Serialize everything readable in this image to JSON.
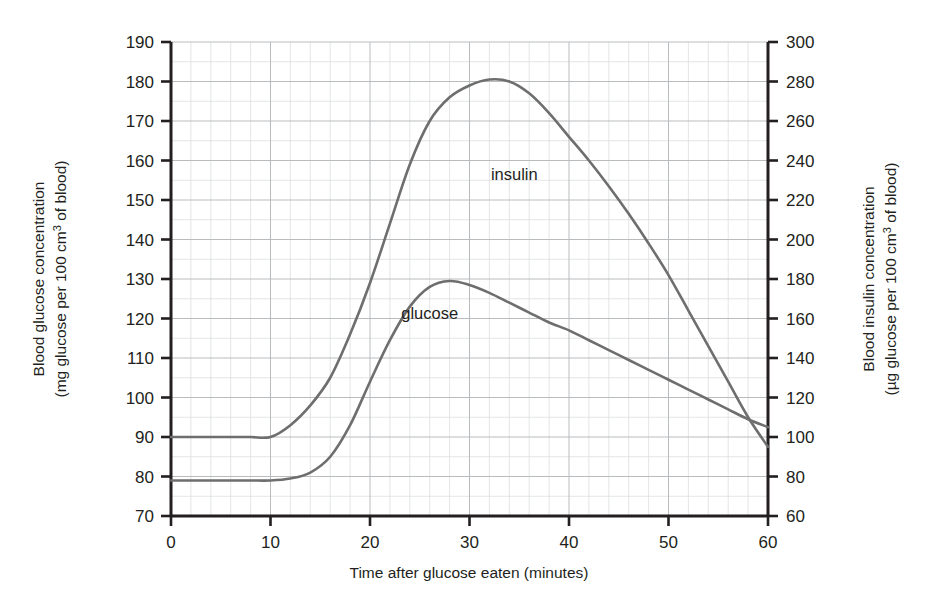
{
  "chart_data": {
    "type": "line",
    "title": "",
    "xlabel": "Time after glucose eaten (minutes)",
    "ylabel": "Blood glucose concentration (mg glucose per 100 cm3 of blood)",
    "y2label": "Blood insulin concentration (µg glucose per 100 cm3 of blood)",
    "grid": true,
    "legend_position": "inline-annotations",
    "xlim": [
      0,
      60
    ],
    "ylim": [
      70,
      190
    ],
    "y2lim": [
      60,
      300
    ],
    "x_major_step": 10,
    "x_minor_step": 2,
    "y_major_step": 10,
    "y_minor_step": 5,
    "y2_major_step": 20,
    "xticks": [
      "0",
      "10",
      "20",
      "30",
      "40",
      "50",
      "60"
    ],
    "yticks": [
      "70",
      "80",
      "90",
      "100",
      "110",
      "120",
      "130",
      "140",
      "150",
      "160",
      "170",
      "180",
      "190"
    ],
    "y2ticks": [
      "60",
      "80",
      "100",
      "120",
      "140",
      "160",
      "180",
      "200",
      "220",
      "240",
      "260",
      "280",
      "300"
    ],
    "x": [
      0,
      2,
      4,
      6,
      8,
      10,
      12,
      14,
      16,
      18,
      20,
      22,
      24,
      26,
      28,
      30,
      32,
      34,
      36,
      38,
      40,
      42,
      44,
      46,
      48,
      50,
      52,
      54,
      56,
      58,
      60
    ],
    "series": [
      {
        "name": "glucose",
        "axis": "left",
        "units": "mg glucose per 100 cm3 of blood",
        "color": "#6e6e6e",
        "label_x": 26,
        "label_y": 120,
        "values": [
          79,
          79,
          79,
          79,
          79,
          79,
          79.5,
          81,
          85,
          93,
          104,
          114.5,
          123,
          128,
          129.5,
          128.5,
          126.5,
          124,
          121.5,
          119,
          117,
          114.5,
          112,
          109.5,
          107,
          104.5,
          102,
          99.5,
          97,
          94.5,
          92.5
        ]
      },
      {
        "name": "insulin",
        "axis": "right",
        "units": "µg glucose per 100 cm3 of blood",
        "color": "#6e6e6e",
        "label_x": 34.5,
        "label_y": 230,
        "values": [
          100,
          100,
          100,
          100,
          100,
          100,
          106,
          116,
          130,
          152,
          178,
          208,
          238,
          260,
          272,
          278,
          281,
          280,
          274,
          264,
          252,
          240,
          227,
          213,
          198,
          182,
          164,
          146,
          128,
          110,
          95
        ]
      }
    ],
    "annotations": [
      {
        "text": "insulin",
        "series": "insulin"
      },
      {
        "text": "glucose",
        "series": "glucose"
      }
    ]
  },
  "labels": {
    "x_axis_title": "Time after glucose eaten (minutes)",
    "y_left_line1": "Blood glucose concentration",
    "y_left_line2_a": "(mg glucose per 100 cm",
    "y_left_sup": "3",
    "y_left_line2_b": " of blood)",
    "y_right_line1": "Blood insulin concentration",
    "y_right_line2_a": "(µg glucose per 100 cm",
    "y_right_sup": "3",
    "y_right_line2_b": " of blood)",
    "series_insulin": "insulin",
    "series_glucose": "glucose"
  },
  "style": {
    "axis_color": "#231f20",
    "grid_major_color": "#b9bcbe",
    "grid_minor_color": "#dcdee0",
    "curve_color": "#6e6e6e",
    "background": "#ffffff"
  }
}
